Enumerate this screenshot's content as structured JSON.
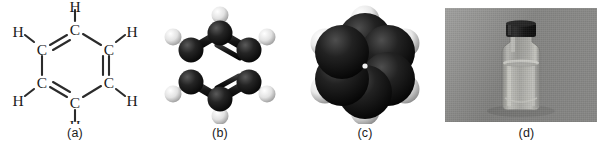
{
  "figure": {
    "background_color": "#ffffff",
    "width": 613,
    "height": 154,
    "panel_count": 4
  },
  "panels": [
    {
      "caption": "(a)",
      "name": "structural-formula",
      "molecule": "benzene",
      "atom_labels": [
        "C",
        "C",
        "C",
        "C",
        "C",
        "C",
        "H",
        "H",
        "H",
        "H",
        "H",
        "H"
      ],
      "carbon_label": "C",
      "hydrogen_label": "H",
      "ring_bonds": [
        "double",
        "single",
        "double",
        "single",
        "double",
        "single"
      ],
      "line_color": "#2b2b2b",
      "text_color": "#1b1b1b"
    },
    {
      "caption": "(b)",
      "name": "ball-and-stick-model",
      "molecule": "benzene",
      "carbon_color": "#1a1a1a",
      "hydrogen_color": "#f2f2f2",
      "bond_color": "#202020",
      "carbon_count": 6,
      "hydrogen_count": 6
    },
    {
      "caption": "(c)",
      "name": "space-filling-model",
      "molecule": "benzene",
      "carbon_color": "#141414",
      "hydrogen_color": "#f4f4f4",
      "carbon_count": 6,
      "hydrogen_count": 6
    },
    {
      "caption": "(d)",
      "name": "sample-photograph",
      "subject": "bottle of liquid benzene",
      "background_color": "#8d8d8b",
      "cap_color": "#1d1d1d",
      "liquid_color": "#b9b9b4",
      "glass_color": "#a6a6a2"
    }
  ]
}
